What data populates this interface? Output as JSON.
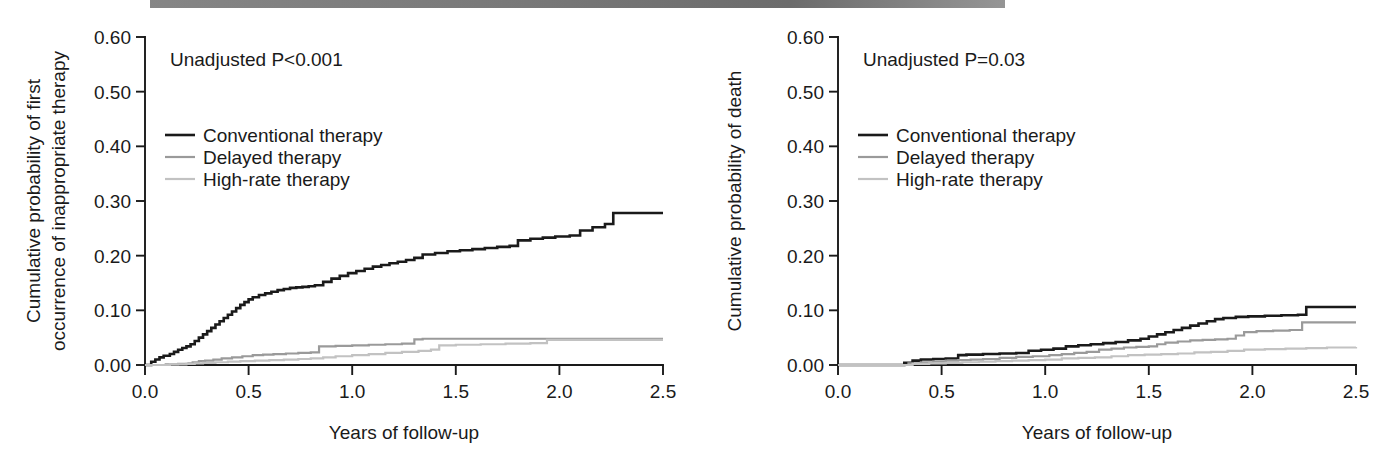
{
  "figure": {
    "kind": "kaplan-meier-two-panel",
    "scan_band_color": "#6e6e6e",
    "background": "#ffffff"
  },
  "series_colors": {
    "conventional": "#1a1a1a",
    "delayed": "#9a9a9a",
    "high_rate": "#c2c2c2"
  },
  "series_widths": {
    "conventional": 2.6,
    "delayed": 2.2,
    "high_rate": 2.2
  },
  "legend": {
    "items": [
      {
        "label": "Conventional therapy",
        "key": "conventional"
      },
      {
        "label": "Delayed therapy",
        "key": "delayed"
      },
      {
        "label": "High-rate therapy",
        "key": "high_rate"
      }
    ]
  },
  "chart_data": [
    {
      "panel": "left",
      "type": "line",
      "title": "",
      "annotation": "Unadjusted P<0.001",
      "xlabel": "Years of follow-up",
      "ylabel": "Cumulative probability of first\noccurrence of inappropriate therapy",
      "ylabel_line1": "Cumulative probability of first",
      "ylabel_line2": "occurrence of inappropriate therapy",
      "xlim": [
        0.0,
        2.5
      ],
      "ylim": [
        0.0,
        0.6
      ],
      "xticks": [
        0.0,
        0.5,
        1.0,
        1.5,
        2.0,
        2.5
      ],
      "xticklabels": [
        "0.0",
        "0.5",
        "1.0",
        "1.5",
        "2.0",
        "2.5"
      ],
      "yticks": [
        0.0,
        0.1,
        0.2,
        0.3,
        0.4,
        0.5,
        0.6
      ],
      "yticklabels": [
        "0.00",
        "0.10",
        "0.20",
        "0.30",
        "0.40",
        "0.50",
        "0.60"
      ],
      "grid": false,
      "legend_position": "upper-left",
      "series": [
        {
          "name": "Conventional therapy",
          "key": "conventional",
          "step": "post",
          "x": [
            0.0,
            0.03,
            0.05,
            0.07,
            0.09,
            0.12,
            0.14,
            0.16,
            0.18,
            0.2,
            0.22,
            0.24,
            0.26,
            0.28,
            0.3,
            0.32,
            0.34,
            0.36,
            0.38,
            0.4,
            0.42,
            0.44,
            0.46,
            0.48,
            0.5,
            0.52,
            0.55,
            0.58,
            0.61,
            0.64,
            0.67,
            0.7,
            0.73,
            0.76,
            0.79,
            0.82,
            0.86,
            0.9,
            0.94,
            0.98,
            1.02,
            1.06,
            1.1,
            1.14,
            1.18,
            1.22,
            1.26,
            1.3,
            1.34,
            1.4,
            1.46,
            1.52,
            1.58,
            1.64,
            1.7,
            1.76,
            1.8,
            1.86,
            1.92,
            1.98,
            2.05,
            2.1,
            2.16,
            2.22,
            2.26,
            2.5
          ],
          "y": [
            0.0,
            0.006,
            0.01,
            0.014,
            0.017,
            0.02,
            0.024,
            0.028,
            0.031,
            0.034,
            0.038,
            0.044,
            0.05,
            0.056,
            0.062,
            0.068,
            0.074,
            0.08,
            0.086,
            0.092,
            0.098,
            0.104,
            0.11,
            0.115,
            0.12,
            0.124,
            0.128,
            0.131,
            0.134,
            0.137,
            0.139,
            0.141,
            0.142,
            0.143,
            0.144,
            0.146,
            0.152,
            0.158,
            0.163,
            0.168,
            0.172,
            0.176,
            0.18,
            0.183,
            0.186,
            0.189,
            0.192,
            0.196,
            0.202,
            0.205,
            0.208,
            0.21,
            0.212,
            0.214,
            0.216,
            0.218,
            0.228,
            0.231,
            0.233,
            0.235,
            0.237,
            0.246,
            0.252,
            0.258,
            0.278,
            0.278
          ]
        },
        {
          "name": "Delayed therapy",
          "key": "delayed",
          "step": "post",
          "x": [
            0.0,
            0.1,
            0.16,
            0.21,
            0.23,
            0.26,
            0.29,
            0.33,
            0.37,
            0.42,
            0.47,
            0.52,
            0.57,
            0.62,
            0.68,
            0.74,
            0.8,
            0.84,
            0.92,
            1.0,
            1.08,
            1.16,
            1.24,
            1.3,
            1.34,
            1.4,
            1.5,
            1.7,
            1.9,
            2.1,
            2.3,
            2.5
          ],
          "y": [
            0.0,
            0.001,
            0.002,
            0.003,
            0.005,
            0.007,
            0.008,
            0.01,
            0.012,
            0.014,
            0.016,
            0.018,
            0.019,
            0.02,
            0.021,
            0.022,
            0.023,
            0.034,
            0.035,
            0.036,
            0.037,
            0.038,
            0.039,
            0.047,
            0.048,
            0.048,
            0.048,
            0.048,
            0.048,
            0.048,
            0.048,
            0.048
          ]
        },
        {
          "name": "High-rate therapy",
          "key": "high_rate",
          "step": "post",
          "x": [
            0.0,
            0.12,
            0.2,
            0.24,
            0.28,
            0.34,
            0.4,
            0.46,
            0.53,
            0.6,
            0.67,
            0.74,
            0.8,
            0.86,
            0.92,
            1.0,
            1.08,
            1.16,
            1.24,
            1.32,
            1.38,
            1.42,
            1.5,
            1.62,
            1.74,
            1.86,
            1.94,
            2.02,
            2.2,
            2.5
          ],
          "y": [
            0.0,
            0.001,
            0.002,
            0.003,
            0.004,
            0.005,
            0.006,
            0.007,
            0.008,
            0.009,
            0.01,
            0.011,
            0.012,
            0.014,
            0.016,
            0.018,
            0.02,
            0.022,
            0.024,
            0.026,
            0.028,
            0.036,
            0.037,
            0.038,
            0.039,
            0.04,
            0.046,
            0.046,
            0.046,
            0.046
          ]
        }
      ]
    },
    {
      "panel": "right",
      "type": "line",
      "title": "",
      "annotation": "Unadjusted P=0.03",
      "xlabel": "Years of follow-up",
      "ylabel": "Cumulative probability of death",
      "ylabel_line1": "Cumulative probability of death",
      "ylabel_line2": "",
      "xlim": [
        0.0,
        2.5
      ],
      "ylim": [
        0.0,
        0.6
      ],
      "xticks": [
        0.0,
        0.5,
        1.0,
        1.5,
        2.0,
        2.5
      ],
      "xticklabels": [
        "0.0",
        "0.5",
        "1.0",
        "1.5",
        "2.0",
        "2.5"
      ],
      "yticks": [
        0.0,
        0.1,
        0.2,
        0.3,
        0.4,
        0.5,
        0.6
      ],
      "yticklabels": [
        "0.00",
        "0.10",
        "0.20",
        "0.30",
        "0.40",
        "0.50",
        "0.60"
      ],
      "grid": false,
      "legend_position": "upper-left",
      "series": [
        {
          "name": "Conventional therapy",
          "key": "conventional",
          "step": "post",
          "x": [
            0.0,
            0.28,
            0.32,
            0.36,
            0.4,
            0.46,
            0.52,
            0.58,
            0.62,
            0.7,
            0.78,
            0.86,
            0.92,
            0.98,
            1.04,
            1.1,
            1.16,
            1.22,
            1.28,
            1.34,
            1.4,
            1.46,
            1.5,
            1.54,
            1.58,
            1.62,
            1.66,
            1.7,
            1.74,
            1.78,
            1.82,
            1.86,
            1.92,
            1.98,
            2.06,
            2.14,
            2.22,
            2.26,
            2.5
          ],
          "y": [
            0.0,
            0.0,
            0.004,
            0.008,
            0.01,
            0.011,
            0.012,
            0.018,
            0.019,
            0.02,
            0.021,
            0.022,
            0.026,
            0.028,
            0.03,
            0.034,
            0.036,
            0.038,
            0.04,
            0.042,
            0.045,
            0.048,
            0.052,
            0.056,
            0.06,
            0.064,
            0.068,
            0.072,
            0.076,
            0.08,
            0.084,
            0.086,
            0.088,
            0.089,
            0.09,
            0.091,
            0.092,
            0.106,
            0.106
          ]
        },
        {
          "name": "Delayed therapy",
          "key": "delayed",
          "step": "post",
          "x": [
            0.0,
            0.3,
            0.34,
            0.4,
            0.46,
            0.52,
            0.58,
            0.64,
            0.7,
            0.78,
            0.86,
            0.94,
            1.02,
            1.08,
            1.14,
            1.2,
            1.26,
            1.32,
            1.38,
            1.44,
            1.5,
            1.54,
            1.58,
            1.64,
            1.7,
            1.76,
            1.82,
            1.88,
            1.92,
            1.96,
            2.02,
            2.1,
            2.18,
            2.24,
            2.5
          ],
          "y": [
            0.0,
            0.0,
            0.003,
            0.005,
            0.006,
            0.008,
            0.009,
            0.01,
            0.011,
            0.013,
            0.015,
            0.016,
            0.018,
            0.02,
            0.022,
            0.024,
            0.028,
            0.03,
            0.032,
            0.033,
            0.034,
            0.038,
            0.041,
            0.043,
            0.045,
            0.046,
            0.047,
            0.048,
            0.054,
            0.06,
            0.062,
            0.063,
            0.064,
            0.078,
            0.078
          ]
        },
        {
          "name": "High-rate therapy",
          "key": "high_rate",
          "step": "post",
          "x": [
            0.0,
            0.3,
            0.36,
            0.44,
            0.52,
            0.6,
            0.68,
            0.76,
            0.84,
            0.92,
            1.0,
            1.08,
            1.16,
            1.24,
            1.32,
            1.4,
            1.48,
            1.56,
            1.64,
            1.72,
            1.8,
            1.88,
            1.96,
            2.06,
            2.16,
            2.26,
            2.36,
            2.5
          ],
          "y": [
            0.0,
            0.0,
            0.002,
            0.003,
            0.004,
            0.005,
            0.006,
            0.007,
            0.008,
            0.009,
            0.01,
            0.012,
            0.013,
            0.014,
            0.016,
            0.018,
            0.019,
            0.02,
            0.021,
            0.023,
            0.024,
            0.026,
            0.028,
            0.029,
            0.03,
            0.031,
            0.032,
            0.033
          ]
        }
      ]
    }
  ]
}
